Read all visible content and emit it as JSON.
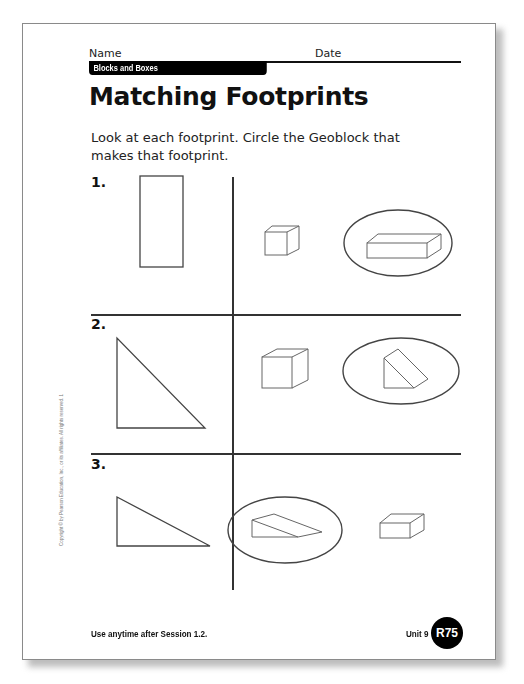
{
  "header": {
    "name_label": "Name",
    "date_label": "Date",
    "unit_title": "Blocks and Boxes"
  },
  "title": "Matching Footprints",
  "instructions": "Look at each footprint. Circle the Geoblock that makes that footprint.",
  "problems": [
    {
      "number": "1.",
      "footprint": "tall rectangle",
      "choices": [
        {
          "shape": "small cube",
          "circled": false
        },
        {
          "shape": "long rectangular prism",
          "circled": true
        }
      ]
    },
    {
      "number": "2.",
      "footprint": "right triangle (tall)",
      "choices": [
        {
          "shape": "cube",
          "circled": false
        },
        {
          "shape": "triangular prism standing",
          "circled": true
        }
      ]
    },
    {
      "number": "3.",
      "footprint": "right triangle (long, flat)",
      "choices": [
        {
          "shape": "wedge / triangular prism lying",
          "circled": true
        },
        {
          "shape": "small rectangular prism",
          "circled": false
        }
      ]
    }
  ],
  "footer": {
    "session_note": "Use anytime after Session 1.2.",
    "unit": "Unit 9",
    "page_id": "R75",
    "copyright": "Copyright © by Pearson Education, Inc., or its affiliates. All rights reserved. 1"
  },
  "colors": {
    "ink": "#111111",
    "line": "#333333",
    "drawing": "#555555",
    "badge_bg": "#000000",
    "badge_text": "#ffffff"
  }
}
